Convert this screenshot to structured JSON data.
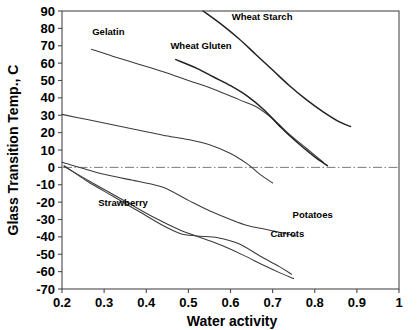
{
  "chart_data": {
    "type": "line",
    "title": "",
    "xlabel": "Water activity",
    "ylabel": "Glass Transition Temp., C",
    "xlim": [
      0.2,
      1.0
    ],
    "ylim": [
      -70,
      90
    ],
    "xticks": [
      "0.2",
      "0.3",
      "0.4",
      "0.5",
      "0.6",
      "0.7",
      "0.8",
      "0.9",
      "1"
    ],
    "xtick_values": [
      0.2,
      0.3,
      0.4,
      0.5,
      0.6,
      0.7,
      0.8,
      0.9,
      1.0
    ],
    "yticks": [
      "90",
      "80",
      "70",
      "60",
      "50",
      "40",
      "30",
      "20",
      "10",
      "0",
      "-10",
      "-20",
      "-30",
      "-40",
      "-50",
      "-60",
      "-70"
    ],
    "ytick_values": [
      90,
      80,
      70,
      60,
      50,
      40,
      30,
      20,
      10,
      0,
      -10,
      -20,
      -30,
      -40,
      -50,
      -60,
      -70
    ],
    "grid": false,
    "legend": "inline-annotations",
    "reference_lines": [
      {
        "name": "zero-degree-line",
        "axis": "y",
        "value": 0,
        "style": "dash-dot"
      }
    ],
    "series": [
      {
        "name": "Gelatin",
        "label": "Gelatin",
        "label_x": 0.31,
        "label_y": 76,
        "points": [
          [
            0.27,
            68.0
          ],
          [
            0.32,
            64.0
          ],
          [
            0.38,
            59.5
          ],
          [
            0.44,
            55.0
          ],
          [
            0.5,
            50.0
          ],
          [
            0.56,
            45.0
          ],
          [
            0.62,
            39.0
          ],
          [
            0.66,
            35.0
          ],
          [
            0.7,
            28.0
          ],
          [
            0.74,
            19.0
          ],
          [
            0.78,
            11.0
          ],
          [
            0.82,
            3.0
          ]
        ]
      },
      {
        "name": "Wheat Gluten",
        "label": "Wheat Gluten",
        "label_x": 0.53,
        "label_y": 68,
        "points": [
          [
            0.47,
            62.0
          ],
          [
            0.52,
            57.0
          ],
          [
            0.56,
            52.0
          ],
          [
            0.6,
            47.0
          ],
          [
            0.64,
            41.0
          ],
          [
            0.68,
            33.0
          ],
          [
            0.72,
            23.0
          ],
          [
            0.76,
            14.0
          ],
          [
            0.8,
            6.0
          ],
          [
            0.83,
            1.0
          ]
        ]
      },
      {
        "name": "Wheat Starch",
        "label": "Wheat Starch",
        "label_x": 0.675,
        "label_y": 85,
        "points": [
          [
            0.535,
            90.0
          ],
          [
            0.58,
            82.0
          ],
          [
            0.62,
            74.0
          ],
          [
            0.66,
            65.0
          ],
          [
            0.7,
            56.0
          ],
          [
            0.74,
            47.0
          ],
          [
            0.78,
            39.0
          ],
          [
            0.82,
            32.0
          ],
          [
            0.86,
            26.0
          ],
          [
            0.885,
            23.5
          ]
        ]
      },
      {
        "name": "Unlabeled mid curve",
        "label": "",
        "points": [
          [
            0.2,
            30.5
          ],
          [
            0.26,
            27.5
          ],
          [
            0.32,
            24.5
          ],
          [
            0.38,
            21.5
          ],
          [
            0.44,
            18.5
          ],
          [
            0.5,
            16.0
          ],
          [
            0.55,
            13.0
          ],
          [
            0.6,
            8.0
          ],
          [
            0.64,
            2.0
          ],
          [
            0.67,
            -4.0
          ],
          [
            0.7,
            -9.0
          ]
        ]
      },
      {
        "name": "Potatoes",
        "label": "Potatoes",
        "label_x": 0.795,
        "label_y": -29,
        "points": [
          [
            0.2,
            3.0
          ],
          [
            0.3,
            -4.0
          ],
          [
            0.38,
            -8.0
          ],
          [
            0.44,
            -11.5
          ],
          [
            0.5,
            -19.0
          ],
          [
            0.55,
            -25.0
          ],
          [
            0.6,
            -30.0
          ],
          [
            0.64,
            -33.5
          ],
          [
            0.68,
            -35.5
          ],
          [
            0.72,
            -37.5
          ],
          [
            0.755,
            -39.5
          ]
        ]
      },
      {
        "name": "Strawberry",
        "label": "Strawberry",
        "label_x": 0.345,
        "label_y": -22,
        "points": [
          [
            0.205,
            1.0
          ],
          [
            0.26,
            -8.0
          ],
          [
            0.32,
            -16.5
          ],
          [
            0.38,
            -25.0
          ],
          [
            0.44,
            -33.5
          ],
          [
            0.48,
            -38.0
          ],
          [
            0.52,
            -39.5
          ],
          [
            0.57,
            -40.5
          ],
          [
            0.62,
            -44.0
          ],
          [
            0.67,
            -51.0
          ],
          [
            0.715,
            -57.0
          ],
          [
            0.745,
            -61.5
          ]
        ]
      },
      {
        "name": "Carrots",
        "label": "Carrots",
        "label_x": 0.735,
        "label_y": -40,
        "points": [
          [
            0.205,
            0.5
          ],
          [
            0.28,
            -10.0
          ],
          [
            0.35,
            -19.5
          ],
          [
            0.42,
            -29.0
          ],
          [
            0.48,
            -36.0
          ],
          [
            0.53,
            -40.5
          ],
          [
            0.58,
            -45.0
          ],
          [
            0.63,
            -50.5
          ],
          [
            0.68,
            -56.5
          ],
          [
            0.72,
            -61.0
          ],
          [
            0.75,
            -64.0
          ]
        ]
      }
    ]
  }
}
